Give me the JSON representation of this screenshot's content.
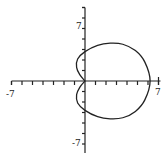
{
  "chart_data": {
    "type": "line",
    "title": "",
    "xlabel": "",
    "ylabel": "",
    "xlim": [
      -7,
      7
    ],
    "ylim": [
      -7,
      7
    ],
    "grid": false,
    "legend": null,
    "tick_labels": {
      "x_min": "-7",
      "x_max": "7",
      "y_min": "-7",
      "y_max": "7"
    },
    "ticks_per_half_axis": 7,
    "curve": {
      "description": "closed polar curve: large loop to the right (x max ~6.2, y range ~±3.6) with two small lobes on the left meeting at the origin (left extent ~-0.8, y-axis crossings ~±2.8)",
      "series": [
        {
          "name": "polar curve",
          "points": [
            [
              0,
              0
            ],
            [
              -0.5,
              0.6
            ],
            [
              -0.8,
              1.3
            ],
            [
              -0.7,
              2.1
            ],
            [
              0,
              2.8
            ],
            [
              1.2,
              3.4
            ],
            [
              2.4,
              3.6
            ],
            [
              3.6,
              3.5
            ],
            [
              4.8,
              2.9
            ],
            [
              5.7,
              1.8
            ],
            [
              6.2,
              0
            ],
            [
              5.7,
              -1.8
            ],
            [
              4.8,
              -2.9
            ],
            [
              3.6,
              -3.5
            ],
            [
              2.4,
              -3.6
            ],
            [
              1.2,
              -3.4
            ],
            [
              0,
              -2.8
            ],
            [
              -0.7,
              -2.1
            ],
            [
              -0.8,
              -1.3
            ],
            [
              -0.5,
              -0.6
            ],
            [
              0,
              0
            ]
          ]
        }
      ]
    },
    "colors": {
      "axis": "#222222",
      "curve": "#222222",
      "background": "#ffffff"
    }
  }
}
